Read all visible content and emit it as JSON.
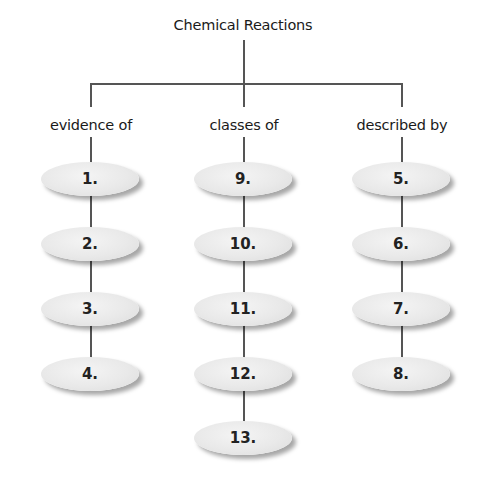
{
  "title": "Chemical Reactions",
  "branches": [
    {
      "label": "evidence of",
      "nodes": [
        "1.",
        "2.",
        "3.",
        "4."
      ]
    },
    {
      "label": "classes of",
      "nodes": [
        "9.",
        "10.",
        "11.",
        "12.",
        "13."
      ]
    },
    {
      "label": "described by",
      "nodes": [
        "5.",
        "6.",
        "7.",
        "8."
      ]
    }
  ],
  "colors": {
    "node_fill": "#e9e9e9",
    "line": "#555555",
    "text": "#1a1a1a"
  }
}
